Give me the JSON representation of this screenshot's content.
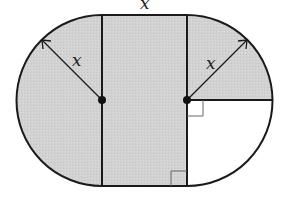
{
  "diagram": {
    "labels": {
      "top_width": "x",
      "left_radius": "x",
      "right_radius": "x"
    },
    "colors": {
      "shade": "#d3d3d3",
      "stroke": "#1a1a1a",
      "unshaded": "#ffffff"
    }
  }
}
